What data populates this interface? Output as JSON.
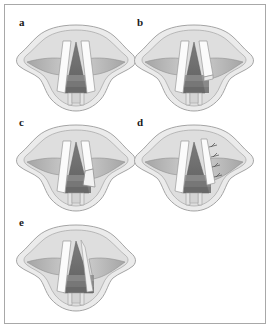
{
  "figure": {
    "type": "medical-illustration",
    "modality": "laryngoscopic-view",
    "style": "grayscale line-and-wash anatomical drawing",
    "panel_count": 5,
    "panel_arrangement": "2 x 2 grid plus one panel on third row, left aligned",
    "border_color": "#a8a8a8",
    "background_color": "#ffffff"
  },
  "palette": {
    "outline": "#8d8d8d",
    "outer_tissue": "#ebebeb",
    "mid_tissue": "#dcdcdc",
    "ventricular_fold": "#b4b4b4",
    "ventricular_fold_dark": "#9a9a9a",
    "vocal_cord_white": "#fbfbfb",
    "glottis_dark": "#6e6e6e",
    "glottis_darker": "#5c5c5c",
    "trachea_band_1": "#8a8a8a",
    "trachea_band_2": "#777777",
    "trachea_band_3": "#6a6a6a",
    "suture_color": "#5a5a5a",
    "label_color": "#1a1a1a"
  },
  "panels": [
    {
      "id": "panel-a",
      "label": "a",
      "position": {
        "row": 1,
        "col": 1
      },
      "caption_text": "a",
      "stage": "Baseline laryngoscopic view: both vocal cords intact, narrow glottic airway"
    },
    {
      "id": "panel-b",
      "label": "b",
      "position": {
        "row": 1,
        "col": 2
      },
      "caption_text": "b",
      "stage": "Right vocal cord transected at its posterior end"
    },
    {
      "id": "panel-c",
      "label": "c",
      "position": {
        "row": 2,
        "col": 1
      },
      "caption_text": "c",
      "stage": "Triangular mucosal flap elevated from the right vocal cord"
    },
    {
      "id": "panel-d",
      "label": "d",
      "position": {
        "row": 2,
        "col": 2
      },
      "caption_text": "d",
      "stage": "Flap lateralised and secured with interrupted sutures"
    },
    {
      "id": "panel-e",
      "label": "e",
      "position": {
        "row": 3,
        "col": 1
      },
      "caption_text": "e",
      "stage": "Final healed result: widened glottic airway"
    }
  ],
  "annotations": {
    "suture_count_panel_d": 4
  }
}
